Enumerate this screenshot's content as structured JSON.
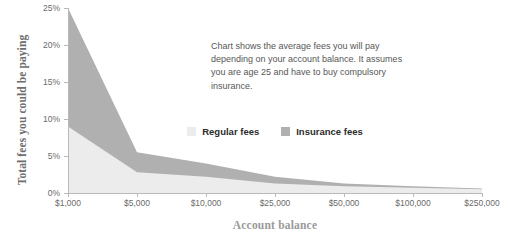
{
  "chart_data": {
    "type": "area",
    "stacked": true,
    "title": "",
    "subtitle": "",
    "xlabel": "Account balance",
    "ylabel": "Total fees you could be paying",
    "categories": [
      "$1,000",
      "$5,000",
      "$10,000",
      "$25,000",
      "$50,000",
      "$100,000",
      "$250,000"
    ],
    "series": [
      {
        "name": "Regular fees",
        "color": "#ececec",
        "values": [
          9.0,
          2.8,
          2.2,
          1.3,
          0.9,
          0.7,
          0.5
        ]
      },
      {
        "name": "Insurance fees",
        "color": "#b0b0b0",
        "values": [
          16.0,
          2.7,
          1.8,
          0.9,
          0.4,
          0.2,
          0.1
        ]
      }
    ],
    "totals": [
      25.0,
      5.5,
      4.0,
      2.2,
      1.3,
      0.9,
      0.6
    ],
    "ylim": [
      0,
      25
    ],
    "ytick_labels": [
      "0%",
      "5%",
      "10%",
      "15%",
      "20%",
      "25%"
    ],
    "ytick_values": [
      0,
      5,
      10,
      15,
      20,
      25
    ],
    "grid": false,
    "legend_position": "center",
    "annotation": "Chart shows the average fees you will pay depending on your account balance. It assumes you are age 25 and have to buy compulsory insurance."
  },
  "axes": {
    "y_title": "Total fees you could be paying",
    "x_title": "Account balance"
  },
  "legend": {
    "items": [
      {
        "label": "Regular fees",
        "color": "#ececec"
      },
      {
        "label": "Insurance fees",
        "color": "#b0b0b0"
      }
    ]
  },
  "annotation": {
    "text": "Chart shows the average fees you will pay depending on your account balance. It assumes you are age 25 and have to buy compulsory insurance."
  },
  "colors": {
    "regular_fees": "#ececec",
    "insurance_fees": "#b0b0b0",
    "axis_line": "#b9b9b9",
    "tick_text": "#6b6b6b",
    "y_title": "#6e6e6e",
    "x_title": "#9a9a9a",
    "annotation_text": "#575757",
    "legend_text": "#2b2b2b",
    "background": "#ffffff"
  }
}
